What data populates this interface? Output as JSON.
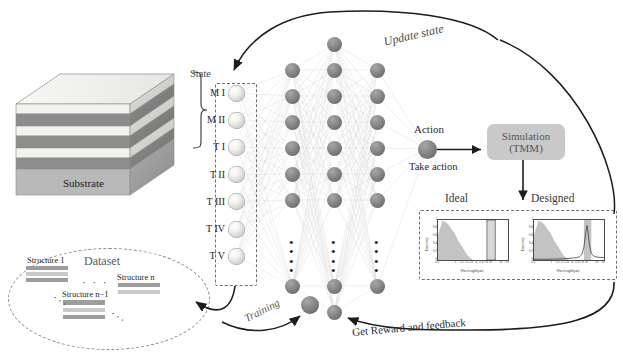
{
  "figure": {
    "type": "reinforcement-learning-workflow-diagram",
    "title_text": ""
  },
  "stack": {
    "label": "Substrate",
    "layer_count": 7,
    "layer_colors": [
      "#efefec",
      "#8d8d8d",
      "#efefec",
      "#8d8d8d",
      "#efefec",
      "#8d8d8d",
      "#b9b9b9"
    ]
  },
  "state": {
    "title": "State",
    "nodes": [
      {
        "label": "M I"
      },
      {
        "label": "M II"
      },
      {
        "label": "T I"
      },
      {
        "label": "T II"
      },
      {
        "label": "T III"
      },
      {
        "label": "T IV"
      },
      {
        "label": "T V"
      }
    ]
  },
  "network": {
    "vertical_dots": "⋮",
    "layers": [
      {
        "name": "hidden-layer-1",
        "visible_nodes": 7
      },
      {
        "name": "hidden-layer-2",
        "visible_nodes": 8
      },
      {
        "name": "hidden-layer-3",
        "visible_nodes": 7
      }
    ]
  },
  "action": {
    "label": "Action",
    "caption": "Take action"
  },
  "simulation": {
    "line1": "Simulation",
    "line2": "(TMM)"
  },
  "charts_header": {
    "ideal": "Ideal",
    "designed": "Designed"
  },
  "dataset": {
    "title": "Dataset",
    "items": [
      {
        "label": "Structure 1"
      },
      {
        "label": "Structure n−1"
      },
      {
        "label": "Structure n"
      }
    ],
    "ellipsis": "· · ·",
    "dots_small": "···"
  },
  "arrows": {
    "update_state": "Update state",
    "training": "Training",
    "reward": "Get Reward and feedback"
  },
  "colors": {
    "node_dark": "#7a7a7a",
    "node_light": "#e8e8e4",
    "sim_box": "#c9c9c9",
    "dash_border": "#6f6f6f",
    "spectrum_fill": "#b9b9b9",
    "curve": "#3a3a3a",
    "band_fill": "#d8d8d8",
    "text": "#2b2b2b"
  },
  "chart_data": [
    {
      "type": "area",
      "name": "Ideal",
      "title": "Ideal",
      "xlabel": "Wavelength(μm)",
      "ylabel": "Emissivity",
      "xscale": "log",
      "xlim": [
        0.3,
        30
      ],
      "ylim": [
        0,
        1
      ],
      "xtick_labels": [
        "0.3",
        "1",
        "1.5",
        "2",
        "2.5",
        "3",
        "4",
        "5",
        "6",
        "7",
        "8",
        "10",
        "20",
        "30"
      ],
      "ytick_labels": [
        "0",
        "0.2",
        "0.4",
        "0.6",
        "0.8",
        "1"
      ],
      "grid": false,
      "legend": "none",
      "series": [
        {
          "name": "solar spectrum",
          "kind": "area",
          "x": [
            0.3,
            0.4,
            0.5,
            0.6,
            0.7,
            0.9,
            1.1,
            1.4,
            1.8,
            2.2,
            2.6,
            3.0
          ],
          "values": [
            0.62,
            0.98,
            0.95,
            0.88,
            0.8,
            0.66,
            0.5,
            0.36,
            0.2,
            0.1,
            0.04,
            0.0
          ]
        },
        {
          "name": "ideal target band",
          "kind": "step",
          "x": [
            7.5,
            7.5,
            13.0,
            13.0
          ],
          "values": [
            0.0,
            1.0,
            1.0,
            0.0
          ]
        }
      ]
    },
    {
      "type": "line",
      "name": "Designed",
      "title": "Designed",
      "xlabel": "Wavelength(μm)",
      "ylabel": "Emissivity",
      "xscale": "log",
      "xlim": [
        0.3,
        30
      ],
      "ylim": [
        0,
        1
      ],
      "xtick_labels": [
        "0.3",
        "1",
        "1.5",
        "2",
        "2.5",
        "3",
        "4",
        "5",
        "6",
        "7",
        "8",
        "10",
        "20",
        "30"
      ],
      "ytick_labels": [
        "0",
        "0.2",
        "0.4",
        "0.6",
        "0.8",
        "1"
      ],
      "grid": false,
      "legend": "none",
      "series": [
        {
          "name": "solar spectrum",
          "kind": "area",
          "x": [
            0.3,
            0.4,
            0.5,
            0.6,
            0.7,
            0.9,
            1.1,
            1.4,
            1.8,
            2.2,
            2.6,
            3.0
          ],
          "values": [
            0.62,
            0.98,
            0.95,
            0.88,
            0.8,
            0.66,
            0.5,
            0.36,
            0.2,
            0.1,
            0.04,
            0.0
          ]
        },
        {
          "name": "atmospheric window band",
          "kind": "area",
          "x": [
            8.0,
            8.0,
            13.0,
            13.0
          ],
          "values": [
            0.0,
            1.0,
            1.0,
            0.0
          ]
        },
        {
          "name": "designed emissivity",
          "kind": "line",
          "x": [
            0.3,
            1.0,
            2.0,
            3.0,
            4.0,
            5.0,
            6.0,
            7.0,
            8.0,
            9.0,
            9.8,
            10.5,
            11.5,
            13.0,
            16.0,
            20.0,
            30.0
          ],
          "values": [
            0.02,
            0.02,
            0.03,
            0.04,
            0.05,
            0.06,
            0.08,
            0.14,
            0.32,
            0.68,
            0.86,
            0.7,
            0.38,
            0.16,
            0.09,
            0.07,
            0.06
          ]
        }
      ]
    }
  ]
}
